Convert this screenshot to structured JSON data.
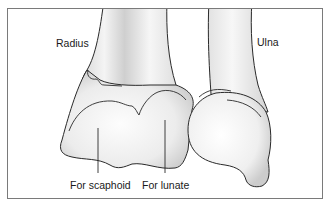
{
  "figure": {
    "labels": {
      "radius": "Radius",
      "ulna": "Ulna",
      "scaphoid": "For scaphoid",
      "lunate": "For lunate"
    },
    "colors": {
      "frame": "#7a7a7a",
      "outline": "#2a2a2a",
      "bone_light": "#fbfbfb",
      "bone_shade": "#cfcfcf",
      "text": "#1a1a1a"
    }
  }
}
